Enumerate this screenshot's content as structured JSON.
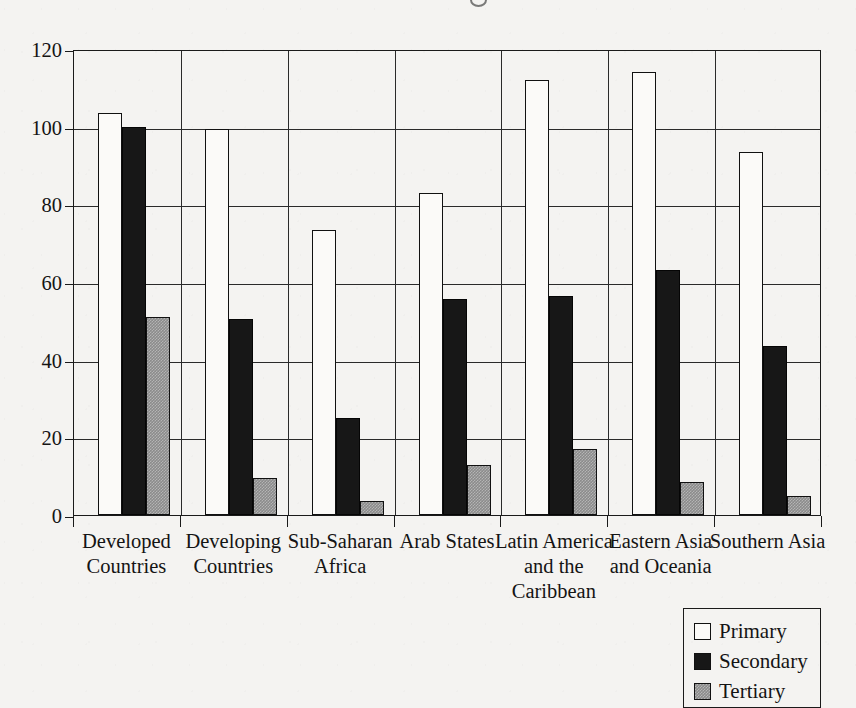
{
  "chart_data": {
    "type": "bar",
    "title": "",
    "subtitle": "",
    "xlabel": "",
    "ylabel": "",
    "ylim": [
      0,
      120
    ],
    "yticks": [
      0,
      20,
      40,
      60,
      80,
      100,
      120
    ],
    "ytick_labels": [
      "0",
      "20",
      "40",
      "60",
      "80",
      "100",
      "120"
    ],
    "grid": true,
    "grid_axis": "y",
    "legend_position": "bottom-right",
    "categories": [
      "Developed\nCountries",
      "Developing\nCountries",
      "Sub-Saharan\nAfrica",
      "Arab States",
      "Latin America\nand the\nCaribbean",
      "Eastern Asia\nand Oceania",
      "Southern Asia"
    ],
    "series": [
      {
        "name": "Primary",
        "color": "#ffffff",
        "values": [
          103.5,
          99.5,
          73.5,
          83,
          112,
          114,
          93.5
        ]
      },
      {
        "name": "Secondary",
        "color": "#000000",
        "values": [
          100,
          50.5,
          25,
          55.5,
          56.5,
          63,
          43.5
        ]
      },
      {
        "name": "Tertiary",
        "color": "#808080",
        "values": [
          51,
          9.5,
          3.5,
          13,
          17,
          8.5,
          5
        ]
      }
    ]
  },
  "legend": {
    "items": [
      {
        "label": "Primary",
        "swatch": "primary"
      },
      {
        "label": "Secondary",
        "swatch": "secondary"
      },
      {
        "label": "Tertiary",
        "swatch": "tertiary"
      }
    ]
  },
  "colors": {
    "background": "#f4f3f1",
    "axis": "#1a1a1a",
    "grid": "#2a2a2a",
    "text": "#141414",
    "primary_bar": "#fbfaf8",
    "secondary_bar": "#171717",
    "tertiary_bar": "#8b8b8b"
  }
}
